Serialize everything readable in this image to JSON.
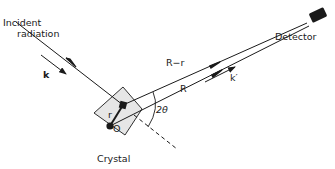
{
  "diagram": {
    "labels": {
      "incident_line1": "Incident",
      "incident_line2": "radiation",
      "k": "k",
      "k_prime": "k′",
      "r_minus_r": "R−r",
      "R": "R",
      "r": "r",
      "O": "O",
      "two_theta": "2θ",
      "crystal": "Crystal",
      "detector": "Detector"
    },
    "colors": {
      "ink": "#1a1a1a",
      "crystal_fill": "#e6e6e6",
      "background": "#ffffff"
    }
  }
}
